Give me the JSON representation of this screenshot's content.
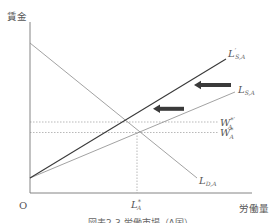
{
  "figure": {
    "y_axis_label": "賃金",
    "x_axis_label": "労働量",
    "origin_label": "O",
    "caption": "図表2-3 労働市場（A国）"
  },
  "curves": {
    "supply_shifted": {
      "symbol": "L",
      "prime": "′",
      "subscript": "S,A"
    },
    "supply": {
      "symbol": "L",
      "subscript": "S,A"
    },
    "demand": {
      "symbol": "L",
      "subscript": "D,A"
    }
  },
  "wage_levels": {
    "new": {
      "symbol": "W",
      "superscript": "*′",
      "subscript": "A"
    },
    "original": {
      "symbol": "W",
      "superscript": "*",
      "subscript": "A"
    }
  },
  "quantity_level": {
    "symbol": "L",
    "superscript": "*",
    "subscript": "A"
  },
  "diagram_data": {
    "type": "supply-demand",
    "x_axis": "労働量",
    "y_axis": "賃金",
    "lines": [
      {
        "name": "L'S,A",
        "kind": "supply (shifted)",
        "slope": "upward",
        "emphasis": "dark"
      },
      {
        "name": "LS,A",
        "kind": "supply (original)",
        "slope": "upward",
        "emphasis": "light"
      },
      {
        "name": "LD,A",
        "kind": "demand",
        "slope": "downward",
        "emphasis": "light"
      }
    ],
    "equilibria": [
      {
        "curves": [
          "L'S,A",
          "LD,A"
        ],
        "wage": "W*'A"
      },
      {
        "curves": [
          "LS,A",
          "LD,A"
        ],
        "wage": "W*A",
        "quantity": "L*A"
      }
    ],
    "shift_arrows": {
      "count": 2,
      "direction": "left"
    }
  },
  "colors": {
    "background": "#ffffff",
    "axis": "#777777",
    "shifted_supply": "#3a3a3a",
    "light_curves": "#8a8a8a",
    "arrows": "#3a3a3a",
    "text": "#555555"
  }
}
